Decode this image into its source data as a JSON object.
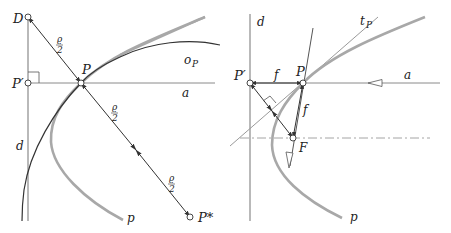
{
  "left_panel": {
    "labels": {
      "D": "D",
      "P_prime": "P′",
      "P": "P",
      "o_P": "o",
      "o_P_sub": "P",
      "a": "a",
      "d": "d",
      "p": "p",
      "P_star": "P*",
      "rho_half_num": "ϱ",
      "rho_half_den": "2"
    }
  },
  "right_panel": {
    "labels": {
      "d": "d",
      "t_P": "t",
      "t_P_sub": "P",
      "P_prime": "P′",
      "P": "P",
      "f_horizontal": "f",
      "f_vertical": "f",
      "a": "a",
      "F": "F",
      "p": "p"
    }
  },
  "colors": {
    "line_dark": "#3a3a3a",
    "curve_gray": "#a8a8a8",
    "axis_gray": "#8a8a8a"
  }
}
